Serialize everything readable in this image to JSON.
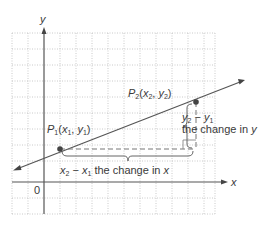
{
  "diagram": {
    "type": "slope-of-line",
    "axes": {
      "x_label": "x",
      "y_label": "y",
      "origin_label": "0"
    },
    "points": {
      "p1": {
        "name": "P",
        "sub": "1",
        "coords_text": "(x",
        "x_var": "x",
        "x_sub": "1",
        "y_var": "y",
        "y_sub": "1",
        "label_full": "P1(x1, y1)"
      },
      "p2": {
        "name": "P",
        "sub": "2",
        "x_var": "x",
        "x_sub": "2",
        "y_var": "y",
        "y_sub": "2",
        "label_full": "P2(x2, y2)"
      }
    },
    "annotations": {
      "run": {
        "a_var": "x",
        "a_sub": "2",
        "minus": " − ",
        "b_var": "x",
        "b_sub": "1",
        "text": " the change in ",
        "var": "x",
        "label_full": "x2 − x1 the change in x"
      },
      "rise": {
        "a_var": "y",
        "a_sub": "2",
        "minus": " − ",
        "b_var": "y",
        "b_sub": "1",
        "text": "the change in ",
        "var": "y",
        "label_full": "y2 − y1 the change in y"
      }
    },
    "colors": {
      "grid": "#b8b8b8",
      "axis": "#555555",
      "line": "#555555",
      "point": "#444444",
      "text": "#3a3a3a"
    }
  }
}
